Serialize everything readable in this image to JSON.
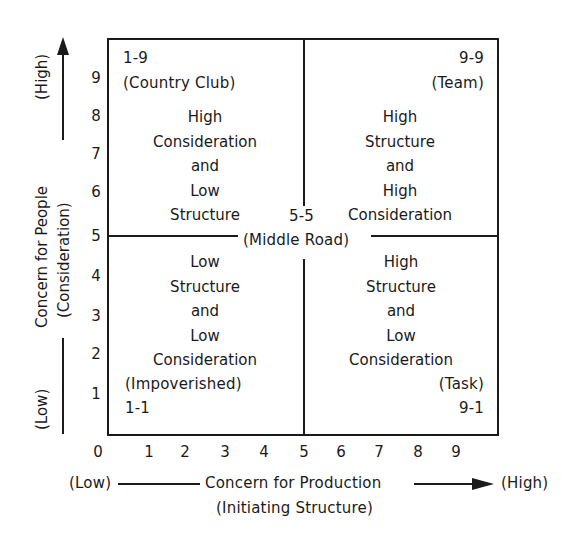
{
  "diagram": {
    "type": "leadership-grid",
    "x_axis": {
      "low_label": "(Low)",
      "high_label": "(High)",
      "title": "Concern for Production",
      "subtitle": "(Initiating Structure)",
      "ticks": [
        "0",
        "1",
        "2",
        "3",
        "4",
        "5",
        "6",
        "7",
        "8",
        "9"
      ]
    },
    "y_axis": {
      "low_label": "(Low)",
      "high_label": "(High)",
      "title": "Concern for People",
      "subtitle": "(Consideration)",
      "ticks": [
        "1",
        "2",
        "3",
        "4",
        "5",
        "6",
        "7",
        "8",
        "9"
      ]
    },
    "quadrants": {
      "top_left": {
        "code": "1-9",
        "style": "(Country Club)",
        "description": [
          "High",
          "Consideration",
          "and",
          "Low",
          "Structure"
        ]
      },
      "top_right": {
        "code": "9-9",
        "style": "(Team)",
        "description": [
          "High",
          "Structure",
          "and",
          "High",
          "Consideration"
        ]
      },
      "bottom_left": {
        "code": "1-1",
        "style": "(Impoverished)",
        "description": [
          "Low",
          "Structure",
          "and",
          "Low",
          "Consideration"
        ]
      },
      "bottom_right": {
        "code": "9-1",
        "style": "(Task)",
        "description": [
          "High",
          "Structure",
          "and",
          "Low",
          "Consideration"
        ]
      }
    },
    "center": {
      "code": "5-5",
      "style": "(Middle Road)"
    },
    "colors": {
      "ink": "#1a1a1a",
      "background": "#ffffff"
    }
  }
}
